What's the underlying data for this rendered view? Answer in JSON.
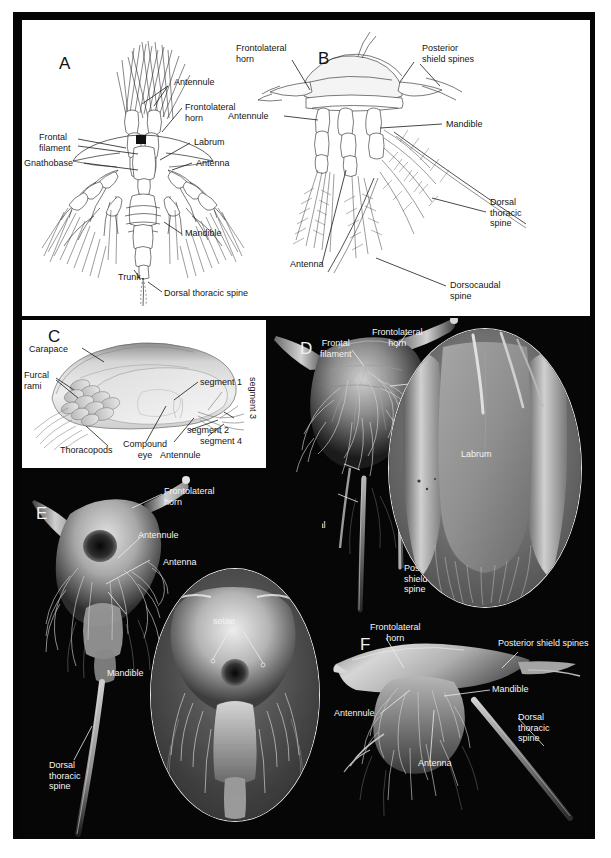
{
  "figure": {
    "panels": [
      "A",
      "B",
      "C",
      "D",
      "E",
      "F"
    ],
    "letters": {
      "a": "A",
      "b": "B",
      "c": "C",
      "d": "D",
      "e": "E",
      "f": "F"
    }
  },
  "panel_a": {
    "letter": "A",
    "labels": {
      "antennule": "Antennule",
      "frontolateral_horn": "Frontolateral\nhorn",
      "frontal_filament": "Frontal\nfilament",
      "labrum": "Labrum",
      "gnathobase": "Gnathobase",
      "antenna": "Antenna",
      "mandible": "Mandible",
      "trunk": "Trunk",
      "dorsal_thoracic_spine": "Dorsal thoracic spine"
    }
  },
  "panel_b": {
    "letter": "B",
    "labels": {
      "frontolateral_horn": "Frontolateral\nhorn",
      "posterior_shield_spines": "Posterior\nshield spines",
      "antennule": "Antennule",
      "mandible": "Mandible",
      "antenna": "Antenna",
      "dorsal_thoracic_spine": "Dorsal\nthoracic\nspine",
      "dorsocaudal_spine": "Dorsocaudal\nspine"
    }
  },
  "panel_c": {
    "letter": "C",
    "labels": {
      "carapace": "Carapace",
      "furcal_rami": "Furcal\nrami",
      "segment_1": "segment 1",
      "segment_2": "segment 2",
      "segment_3": "segment 3",
      "segment_4": "segment 4",
      "thoracopods": "Thoracopods",
      "compound_eye": "Compound\neye",
      "antennule": "Antennule"
    }
  },
  "panel_d": {
    "letter": "D",
    "labels": {
      "frontal_filament": "Frontal\nfilament",
      "frontolateral_horn": "Frontolateral\nhorn",
      "dorsocaudal_spine": "Dorsocaudal\nspine",
      "dorsal_thoracic_spine": "Dorsal\nthoracic\nspine",
      "posterior_shield_spine": "Posterior\nshield\nspine",
      "labrum": "Labrum"
    }
  },
  "panel_e": {
    "letter": "E",
    "labels": {
      "frontolateral_horn": "Frontolateral\nhorn",
      "antennule": "Antennule",
      "antenna": "Antenna",
      "mandible": "Mandible",
      "dorsal_thoracic_spine": "Dorsal\nthoracic\nspine",
      "setae": "setae"
    }
  },
  "panel_f": {
    "letter": "F",
    "labels": {
      "frontolateral_horn": "Frontolateral\nhorn",
      "posterior_shield_spines": "Posterior shield spines",
      "mandible": "Mandible",
      "antennule": "Antennule",
      "antenna": "Antenna",
      "dorsal_thoracic_spine": "Dorsal\nthoracic\nspine"
    }
  },
  "colors": {
    "plate_background": "#050505",
    "drawing_background": "#ffffff",
    "dark_text": "#151515",
    "light_text": "#f4f4f4",
    "leader_dark": "#1a1a1a",
    "leader_light": "#eeeeee"
  }
}
